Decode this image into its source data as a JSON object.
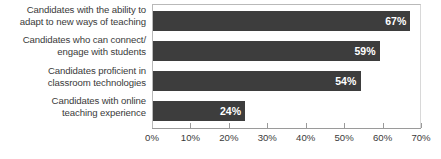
{
  "chart_data": {
    "type": "bar",
    "orientation": "horizontal",
    "title": "",
    "subtitle": "",
    "xlabel": "",
    "ylabel": "",
    "xlim": [
      0,
      70
    ],
    "grid": false,
    "legend": null,
    "bar_color": "#3d3d3d",
    "label_color": "#ffffff",
    "axis_color": "#9a9a9a",
    "text_color": "#3a3a3a",
    "categories": [
      "Candidates with the ability to adapt to new ways of teaching",
      "Candidates who can connect/ engage with students",
      "Candidates proficient in classroom technologies",
      "Candidates with online teaching experience"
    ],
    "category_lines": [
      [
        "Candidates with the ability to",
        "adapt to new ways of teaching"
      ],
      [
        "Candidates who can connect/",
        "engage with students"
      ],
      [
        "Candidates proficient in",
        "classroom technologies"
      ],
      [
        "Candidates with online",
        "teaching experience"
      ]
    ],
    "values": [
      67,
      59,
      54,
      24
    ],
    "data_labels": [
      "67%",
      "59%",
      "54%",
      "24%"
    ],
    "xticks": [
      0,
      10,
      20,
      30,
      40,
      50,
      60,
      70
    ],
    "xticklabels": [
      "0%",
      "10%",
      "20%",
      "30%",
      "40%",
      "50%",
      "60%",
      "70%"
    ]
  }
}
